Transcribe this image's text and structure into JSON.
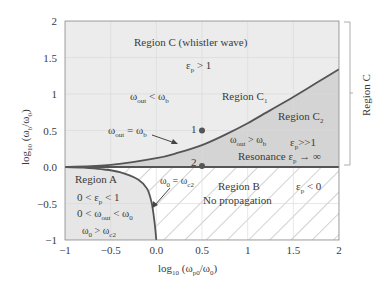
{
  "chart_data": {
    "type": "area",
    "title": "",
    "xlabel": "log10 (ωp0/ω0)",
    "ylabel": "log10 (ωb/ω0)",
    "xlim": [
      -1,
      2
    ],
    "ylim": [
      -1,
      2
    ],
    "grid": true,
    "x_ticks": [
      "-1",
      "-0.5",
      "0.0",
      "0.5",
      "1",
      "1.5",
      "2"
    ],
    "x_tick_values": [
      -1,
      -0.5,
      0,
      0.5,
      1,
      1.5,
      2
    ],
    "y_ticks": [
      "-1",
      "-0.5",
      "0.0",
      "0.5",
      "1",
      "1.5",
      "2"
    ],
    "y_tick_values": [
      -1,
      -0.5,
      0,
      0.5,
      1,
      1.5,
      2
    ],
    "series": [
      {
        "name": "ωout = ωb boundary (whistler curve)",
        "x": [
          -1,
          -0.5,
          0,
          0.25,
          0.5,
          0.75,
          1,
          1.25,
          1.5,
          1.75,
          2
        ],
        "y": [
          0.0,
          0.03,
          0.12,
          0.2,
          0.3,
          0.44,
          0.6,
          0.78,
          0.96,
          1.15,
          1.34
        ]
      },
      {
        "name": "ω0 = ωc2 boundary (Region A)",
        "x": [
          -1,
          -0.8,
          -0.6,
          -0.4,
          -0.2,
          -0.1,
          -0.05,
          -0.02,
          0
        ],
        "y": [
          0,
          -0.01,
          -0.03,
          -0.07,
          -0.17,
          -0.3,
          -0.5,
          -0.75,
          -1
        ]
      },
      {
        "name": "Resonance line",
        "x": [
          -1,
          2
        ],
        "y": [
          0,
          0
        ]
      }
    ],
    "points": [
      {
        "label": "1",
        "x": 0.5,
        "y": 0.5
      },
      {
        "label": "2",
        "x": 0.5,
        "y": 0.0
      }
    ],
    "regions": [
      {
        "name": "Region C (whistler wave)",
        "conditions": [
          "εp > 1",
          "ωout < ωb"
        ]
      },
      {
        "name": "Region C1"
      },
      {
        "name": "Region C2",
        "conditions": [
          "ωout > ωb",
          "εp >> 1",
          "Resonance εp → ∞"
        ]
      },
      {
        "name": "Region A",
        "conditions": [
          "0 < εp < 1",
          "0 < ωout < ω0",
          "ω0 > ωc2"
        ]
      },
      {
        "name": "Region B",
        "conditions": [
          "No propagation",
          "εp < 0"
        ]
      }
    ],
    "annotations": [
      "ωout = ωb",
      "ω0 = ωc2",
      "Region C"
    ]
  },
  "labels": {
    "region_c_title": "Region C (whistler wave)",
    "eps_gt_1": "ε",
    "eps_gt_1_sub": "p",
    "eps_gt_1_rest": " > 1",
    "wout_lt_wb": "ω",
    "wout_lt_wb_sub": "out",
    "wout_lt_wb_rest": " < ω",
    "wout_lt_wb_sub2": "b",
    "region_c1": "Region C",
    "region_c1_sub": "1",
    "region_c2": "Region C",
    "region_c2_sub": "2",
    "wout_eq_wb": "ω",
    "wout_eq_wb_sub": "out",
    "wout_eq_wb_rest": " = ω",
    "wout_eq_wb_sub2": "b",
    "point1": "1",
    "point2": "2",
    "wout_gt_wb": "ω",
    "wout_gt_wb_sub": "out",
    "wout_gt_wb_rest": " > ω",
    "wout_gt_wb_sub2": "b",
    "eps_gg_1": "ε",
    "eps_gg_1_sub": "p",
    "eps_gg_1_rest": ">>1",
    "resonance": "Resonance ε",
    "resonance_sub": "p",
    "resonance_rest": " → ∞",
    "region_a": "Region A",
    "a_cond1_pre": "0 < ε",
    "a_cond1_sub": "p",
    "a_cond1_rest": " < 1",
    "a_cond2_pre": "0 < ω",
    "a_cond2_sub": "out",
    "a_cond2_mid": " < ω",
    "a_cond2_sub2": "0",
    "a_cond3_pre": "ω",
    "a_cond3_sub": "0",
    "a_cond3_mid": " > ω",
    "a_cond3_sub2": "c2",
    "w0_eq_wc2_pre": "ω",
    "w0_eq_wc2_sub": "0",
    "w0_eq_wc2_mid": " = ω",
    "w0_eq_wc2_sub2": "c2",
    "region_b": "Region B",
    "no_propagation": "No propagation",
    "eps_lt_0": "ε",
    "eps_lt_0_sub": "p",
    "eps_lt_0_rest": " < 0",
    "bracket_label": "Region C",
    "xlabel_pre": "log",
    "xlabel_sub": "10",
    "xlabel_mid": " (ω",
    "xlabel_sub2": "p0",
    "xlabel_mid2": "/ω",
    "xlabel_sub3": "0",
    "xlabel_end": ")",
    "ylabel_pre": "log",
    "ylabel_sub": "10",
    "ylabel_mid": " (ω",
    "ylabel_sub2": "b",
    "ylabel_mid2": "/ω",
    "ylabel_sub3": "0",
    "ylabel_end": ")"
  },
  "colors": {
    "region_c_fill": "#ececec",
    "region_c2_fill": "#d4d4d4",
    "region_a_fill": "#e6e6e6",
    "region_b_fill": "#ffffff",
    "curve": "#555555",
    "hatch": "#9a9a9a",
    "grid": "#dcdcdc",
    "axis": "#8a8a8a"
  }
}
